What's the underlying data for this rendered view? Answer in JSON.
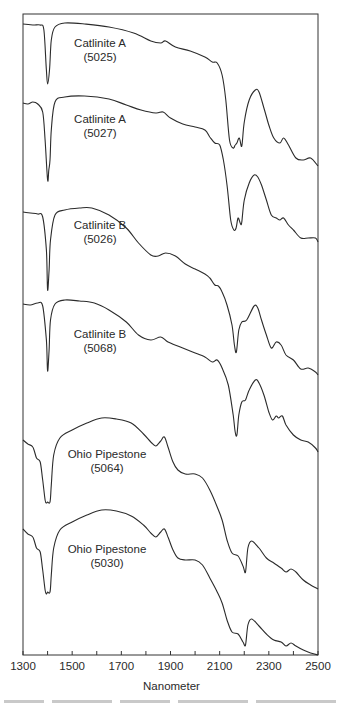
{
  "chart_data": {
    "type": "line",
    "title": "",
    "xlabel": "Nanometer",
    "ylabel": "",
    "xlim": [
      1300,
      2500
    ],
    "x_ticks": [
      1300,
      1500,
      1700,
      1900,
      2100,
      2300,
      2500
    ],
    "x_minor_ticks": [
      1400,
      1600,
      1800,
      2000,
      2200,
      2400
    ],
    "grid": false,
    "legend": "none (inline labels beside each offset spectrum)",
    "stacked_offset": true,
    "y_axis_ticks": "none",
    "series": [
      {
        "name": "Catlinite A (5025)",
        "label_line1": "Catlinite A",
        "label_line2": "(5025)",
        "features": {
          "absorption_minima_nm": [
            1400,
            2165,
            2185
          ],
          "local_max_nm": [
            1870,
            2250
          ],
          "notes": "deep narrow dip at ~1400 nm, broad plateau 1450-2100, steep drop into double dip 2160-2190, peak ~2250, declining shoulders to 2500"
        },
        "points": [
          [
            1300,
            24
          ],
          [
            1340,
            25
          ],
          [
            1370,
            25
          ],
          [
            1385,
            30
          ],
          [
            1395,
            70
          ],
          [
            1400,
            84
          ],
          [
            1408,
            70
          ],
          [
            1415,
            40
          ],
          [
            1430,
            27
          ],
          [
            1470,
            23
          ],
          [
            1550,
            24
          ],
          [
            1650,
            27
          ],
          [
            1750,
            33
          ],
          [
            1820,
            41
          ],
          [
            1860,
            43
          ],
          [
            1880,
            41
          ],
          [
            1920,
            47
          ],
          [
            1980,
            51
          ],
          [
            2040,
            57
          ],
          [
            2070,
            62
          ],
          [
            2090,
            63
          ],
          [
            2110,
            75
          ],
          [
            2125,
            100
          ],
          [
            2140,
            140
          ],
          [
            2155,
            148
          ],
          [
            2163,
            145
          ],
          [
            2170,
            143
          ],
          [
            2180,
            138
          ],
          [
            2190,
            146
          ],
          [
            2200,
            122
          ],
          [
            2220,
            100
          ],
          [
            2245,
            90
          ],
          [
            2260,
            92
          ],
          [
            2280,
            108
          ],
          [
            2300,
            125
          ],
          [
            2320,
            138
          ],
          [
            2345,
            143
          ],
          [
            2360,
            138
          ],
          [
            2380,
            145
          ],
          [
            2410,
            158
          ],
          [
            2440,
            160
          ],
          [
            2470,
            158
          ],
          [
            2500,
            166
          ]
        ]
      },
      {
        "name": "Catlinite A (5027)",
        "label_line1": "Catlinite A",
        "label_line2": "(5027)",
        "features": {
          "absorption_minima_nm": [
            1400,
            2165,
            2185
          ],
          "local_max_nm": [
            1870,
            2250
          ]
        },
        "points": [
          [
            1300,
            103
          ],
          [
            1320,
            104
          ],
          [
            1340,
            102
          ],
          [
            1360,
            104
          ],
          [
            1380,
            112
          ],
          [
            1390,
            140
          ],
          [
            1400,
            180
          ],
          [
            1405,
            170
          ],
          [
            1410,
            160
          ],
          [
            1415,
            130
          ],
          [
            1430,
            102
          ],
          [
            1470,
            97
          ],
          [
            1550,
            96
          ],
          [
            1650,
            99
          ],
          [
            1720,
            105
          ],
          [
            1780,
            110
          ],
          [
            1840,
            113
          ],
          [
            1870,
            112
          ],
          [
            1900,
            118
          ],
          [
            1950,
            124
          ],
          [
            2000,
            127
          ],
          [
            2040,
            130
          ],
          [
            2060,
            137
          ],
          [
            2080,
            143
          ],
          [
            2100,
            145
          ],
          [
            2115,
            160
          ],
          [
            2130,
            185
          ],
          [
            2145,
            220
          ],
          [
            2158,
            230
          ],
          [
            2167,
            228
          ],
          [
            2175,
            218
          ],
          [
            2185,
            224
          ],
          [
            2190,
            222
          ],
          [
            2200,
            200
          ],
          [
            2220,
            183
          ],
          [
            2240,
            175
          ],
          [
            2255,
            177
          ],
          [
            2270,
            185
          ],
          [
            2290,
            200
          ],
          [
            2310,
            215
          ],
          [
            2330,
            218
          ],
          [
            2345,
            220
          ],
          [
            2360,
            218
          ],
          [
            2380,
            225
          ],
          [
            2400,
            230
          ],
          [
            2430,
            238
          ],
          [
            2460,
            238
          ],
          [
            2490,
            238
          ],
          [
            2500,
            242
          ]
        ]
      },
      {
        "name": "Catlinite B (5026)",
        "label_line1": "Catlinite B",
        "label_line2": "(5026)",
        "features": {
          "absorption_minima_nm": [
            1400,
            2170
          ],
          "local_max_nm": [
            1580,
            1870,
            2250
          ]
        },
        "points": [
          [
            1300,
            212
          ],
          [
            1330,
            213
          ],
          [
            1360,
            214
          ],
          [
            1380,
            217
          ],
          [
            1395,
            250
          ],
          [
            1400,
            290
          ],
          [
            1406,
            270
          ],
          [
            1412,
            240
          ],
          [
            1430,
            215
          ],
          [
            1470,
            210
          ],
          [
            1530,
            208
          ],
          [
            1580,
            208
          ],
          [
            1650,
            215
          ],
          [
            1720,
            228
          ],
          [
            1770,
            243
          ],
          [
            1820,
            255
          ],
          [
            1850,
            256
          ],
          [
            1880,
            253
          ],
          [
            1920,
            256
          ],
          [
            1960,
            264
          ],
          [
            2000,
            269
          ],
          [
            2040,
            274
          ],
          [
            2060,
            278
          ],
          [
            2080,
            285
          ],
          [
            2095,
            286
          ],
          [
            2110,
            292
          ],
          [
            2130,
            305
          ],
          [
            2150,
            325
          ],
          [
            2160,
            345
          ],
          [
            2168,
            352
          ],
          [
            2178,
            330
          ],
          [
            2190,
            322
          ],
          [
            2210,
            320
          ],
          [
            2240,
            306
          ],
          [
            2255,
            308
          ],
          [
            2270,
            320
          ],
          [
            2290,
            335
          ],
          [
            2310,
            348
          ],
          [
            2330,
            342
          ],
          [
            2350,
            345
          ],
          [
            2370,
            355
          ],
          [
            2400,
            360
          ],
          [
            2430,
            369
          ],
          [
            2460,
            368
          ],
          [
            2490,
            372
          ],
          [
            2500,
            375
          ]
        ]
      },
      {
        "name": "Catlinite B (5068)",
        "label_line1": "Catlinite B",
        "label_line2": "(5068)",
        "features": {
          "absorption_minima_nm": [
            1400,
            2170
          ],
          "local_max_nm": [
            1580,
            1870,
            2250
          ]
        },
        "points": [
          [
            1300,
            304
          ],
          [
            1330,
            305
          ],
          [
            1360,
            303
          ],
          [
            1380,
            306
          ],
          [
            1395,
            340
          ],
          [
            1400,
            371
          ],
          [
            1406,
            350
          ],
          [
            1412,
            320
          ],
          [
            1430,
            304
          ],
          [
            1470,
            300
          ],
          [
            1530,
            301
          ],
          [
            1590,
            303
          ],
          [
            1650,
            310
          ],
          [
            1720,
            322
          ],
          [
            1770,
            335
          ],
          [
            1820,
            340
          ],
          [
            1860,
            337
          ],
          [
            1890,
            342
          ],
          [
            1940,
            347
          ],
          [
            1990,
            352
          ],
          [
            2040,
            357
          ],
          [
            2070,
            362
          ],
          [
            2090,
            360
          ],
          [
            2110,
            368
          ],
          [
            2135,
            385
          ],
          [
            2155,
            415
          ],
          [
            2163,
            432
          ],
          [
            2170,
            435
          ],
          [
            2178,
            415
          ],
          [
            2190,
            402
          ],
          [
            2205,
            400
          ],
          [
            2220,
            390
          ],
          [
            2245,
            380
          ],
          [
            2260,
            383
          ],
          [
            2280,
            395
          ],
          [
            2300,
            412
          ],
          [
            2315,
            420
          ],
          [
            2330,
            416
          ],
          [
            2340,
            418
          ],
          [
            2355,
            416
          ],
          [
            2370,
            425
          ],
          [
            2400,
            435
          ],
          [
            2430,
            440
          ],
          [
            2460,
            442
          ],
          [
            2490,
            448
          ],
          [
            2500,
            452
          ]
        ]
      },
      {
        "name": "Ohio Pipestone (5064)",
        "label_line1": "Ohio Pipestone",
        "label_line2": "(5064)",
        "features": {
          "absorption_minima_nm": [
            1395,
            1410,
            2210
          ],
          "local_max_nm": [
            1630,
            1880,
            2230
          ]
        },
        "points": [
          [
            1300,
            440
          ],
          [
            1320,
            444
          ],
          [
            1340,
            447
          ],
          [
            1355,
            458
          ],
          [
            1370,
            462
          ],
          [
            1380,
            480
          ],
          [
            1390,
            500
          ],
          [
            1395,
            503
          ],
          [
            1400,
            502
          ],
          [
            1410,
            502
          ],
          [
            1415,
            485
          ],
          [
            1425,
            455
          ],
          [
            1450,
            438
          ],
          [
            1500,
            430
          ],
          [
            1560,
            423
          ],
          [
            1620,
            418
          ],
          [
            1680,
            419
          ],
          [
            1740,
            423
          ],
          [
            1790,
            434
          ],
          [
            1820,
            442
          ],
          [
            1840,
            446
          ],
          [
            1860,
            441
          ],
          [
            1875,
            437
          ],
          [
            1890,
            447
          ],
          [
            1910,
            462
          ],
          [
            1930,
            470
          ],
          [
            1960,
            474
          ],
          [
            2000,
            474
          ],
          [
            2030,
            478
          ],
          [
            2060,
            490
          ],
          [
            2090,
            507
          ],
          [
            2110,
            520
          ],
          [
            2130,
            540
          ],
          [
            2150,
            553
          ],
          [
            2175,
            556
          ],
          [
            2195,
            566
          ],
          [
            2205,
            572
          ],
          [
            2215,
            548
          ],
          [
            2230,
            541
          ],
          [
            2260,
            548
          ],
          [
            2290,
            558
          ],
          [
            2320,
            563
          ],
          [
            2350,
            568
          ],
          [
            2370,
            572
          ],
          [
            2390,
            569
          ],
          [
            2410,
            572
          ],
          [
            2440,
            580
          ],
          [
            2470,
            585
          ],
          [
            2500,
            589
          ]
        ]
      },
      {
        "name": "Ohio Pipestone (5030)",
        "label_line1": "Ohio Pipestone",
        "label_line2": "(5030)",
        "features": {
          "absorption_minima_nm": [
            1395,
            1410,
            2210
          ],
          "local_max_nm": [
            1630,
            1880,
            2230
          ]
        },
        "points": [
          [
            1300,
            529
          ],
          [
            1320,
            534
          ],
          [
            1340,
            537
          ],
          [
            1355,
            548
          ],
          [
            1370,
            552
          ],
          [
            1380,
            570
          ],
          [
            1390,
            590
          ],
          [
            1395,
            594
          ],
          [
            1400,
            592
          ],
          [
            1410,
            592
          ],
          [
            1415,
            575
          ],
          [
            1425,
            548
          ],
          [
            1450,
            530
          ],
          [
            1500,
            522
          ],
          [
            1560,
            515
          ],
          [
            1620,
            510
          ],
          [
            1680,
            511
          ],
          [
            1740,
            516
          ],
          [
            1790,
            525
          ],
          [
            1820,
            533
          ],
          [
            1840,
            537
          ],
          [
            1860,
            532
          ],
          [
            1875,
            529
          ],
          [
            1890,
            537
          ],
          [
            1910,
            550
          ],
          [
            1930,
            558
          ],
          [
            1960,
            560
          ],
          [
            2000,
            560
          ],
          [
            2030,
            565
          ],
          [
            2060,
            578
          ],
          [
            2090,
            592
          ],
          [
            2110,
            603
          ],
          [
            2130,
            620
          ],
          [
            2150,
            632
          ],
          [
            2175,
            634
          ],
          [
            2195,
            642
          ],
          [
            2205,
            645
          ],
          [
            2215,
            625
          ],
          [
            2230,
            619
          ],
          [
            2260,
            626
          ],
          [
            2290,
            634
          ],
          [
            2320,
            640
          ],
          [
            2350,
            642
          ],
          [
            2370,
            646
          ],
          [
            2390,
            643
          ],
          [
            2410,
            646
          ],
          [
            2440,
            650
          ],
          [
            2470,
            653
          ],
          [
            2500,
            655
          ]
        ]
      }
    ],
    "label_positions_px": [
      {
        "x": 100,
        "y": 36
      },
      {
        "x": 100,
        "y": 112
      },
      {
        "x": 100,
        "y": 218
      },
      {
        "x": 100,
        "y": 327
      },
      {
        "x": 107,
        "y": 447
      },
      {
        "x": 107,
        "y": 542
      }
    ]
  }
}
